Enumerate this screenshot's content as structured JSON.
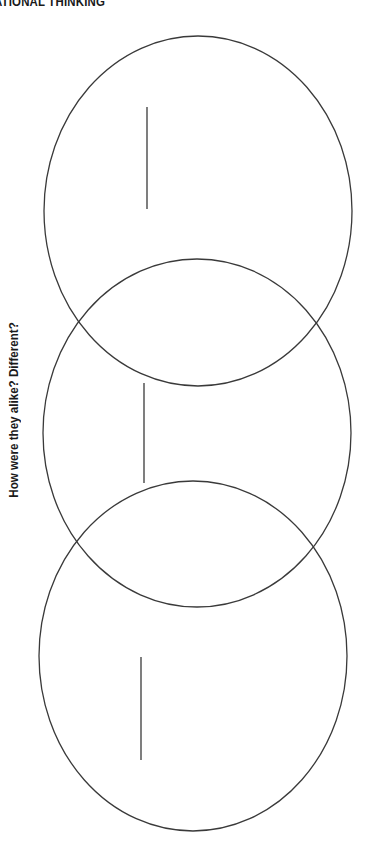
{
  "header": {
    "title": "ATIONAL THINKING"
  },
  "prompt": {
    "question": "How were they alike? Different?"
  },
  "diagram": {
    "type": "three-circle vertical venn diagram",
    "stroke_color": "#3a3a3a",
    "circles": [
      {
        "name": "top",
        "cx": 198,
        "cy": 211,
        "rx": 154,
        "ry": 175
      },
      {
        "name": "middle",
        "cx": 197,
        "cy": 433,
        "rx": 154,
        "ry": 174
      },
      {
        "name": "bottom",
        "cx": 193,
        "cy": 656,
        "rx": 154,
        "ry": 175
      }
    ],
    "writing_lines": [
      {
        "name": "top",
        "x": 147,
        "y1": 107,
        "y2": 209
      },
      {
        "name": "middle",
        "x": 144,
        "y1": 383,
        "y2": 483
      },
      {
        "name": "bottom",
        "x": 141,
        "y1": 657,
        "y2": 760
      }
    ]
  }
}
